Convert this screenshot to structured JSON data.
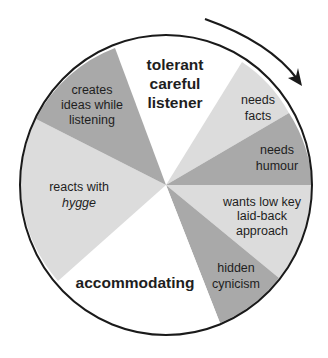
{
  "diagram": {
    "title": "",
    "direction": "clockwise",
    "colors": {
      "white": "#ffffff",
      "light": "#dcdcdc",
      "dark": "#a9a9a9",
      "outline": "#1a1a1a",
      "text": "#1e1e1e"
    },
    "slices": [
      {
        "id": "tolerant",
        "shade": "white",
        "lines": [
          "tolerant",
          "careful",
          "listener"
        ],
        "bold": true
      },
      {
        "id": "needs-facts",
        "shade": "light",
        "lines": [
          "needs",
          "facts"
        ],
        "bold": false
      },
      {
        "id": "needs-humour",
        "shade": "dark",
        "lines": [
          "needs",
          "humour"
        ],
        "bold": false
      },
      {
        "id": "wants-low-key",
        "shade": "light",
        "lines": [
          "wants low key",
          "laid-back",
          "approach"
        ],
        "bold": false
      },
      {
        "id": "hidden-cynicism",
        "shade": "dark",
        "lines": [
          "hidden",
          "cynicism"
        ],
        "bold": false
      },
      {
        "id": "accommodating",
        "shade": "white",
        "lines": [
          "accommodating"
        ],
        "bold": true
      },
      {
        "id": "reacts-hygge",
        "shade": "light",
        "lines": [
          "reacts with",
          "hygge"
        ],
        "bold": false,
        "italic_line": 1
      },
      {
        "id": "creates-ideas",
        "shade": "dark",
        "lines": [
          "creates",
          "ideas while",
          "listening"
        ],
        "bold": false
      }
    ],
    "labels": {
      "tolerant": {
        "l1": "tolerant",
        "l2": "careful",
        "l3": "listener"
      },
      "needs_facts": {
        "l1": "needs",
        "l2": "facts"
      },
      "needs_humour": {
        "l1": "needs",
        "l2": "humour"
      },
      "wants_low_key": {
        "l1": "wants low key",
        "l2": "laid-back",
        "l3": "approach"
      },
      "hidden_cynicism": {
        "l1": "hidden",
        "l2": "cynicism"
      },
      "accommodating": {
        "l1": "accommodating"
      },
      "reacts_hygge": {
        "l1": "reacts with",
        "l2": "hygge"
      },
      "creates_ideas": {
        "l1": "creates",
        "l2": "ideas while",
        "l3": "listening"
      }
    },
    "arrow": {
      "icon": "clockwise-arrow-icon"
    }
  }
}
